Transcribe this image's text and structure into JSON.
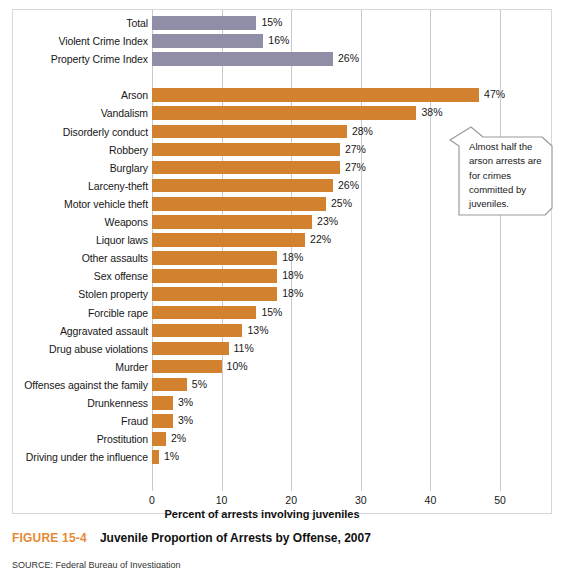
{
  "figure": {
    "number_label": "FIGURE 15-4",
    "title": "Juvenile Proportion of Arrests by Offense, 2007",
    "source_note": "SOURCE: Federal Bureau of Investigation"
  },
  "axis": {
    "x_title": "Percent of arrests involving juveniles",
    "x_ticks": [
      "0",
      "10",
      "20",
      "30",
      "40",
      "50"
    ],
    "x_min": 0,
    "x_max": 50
  },
  "callout": {
    "text": "Almost half the arson arrests are for crimes committed by juveniles."
  },
  "colors": {
    "summary_bar": "#8f8ea6",
    "offense_bar": "#d2822f",
    "caption_accent": "#e58a33",
    "gridline": "#c9c9d2"
  },
  "chart_data": {
    "type": "bar",
    "orientation": "horizontal",
    "title": "Juvenile Proportion of Arrests by Offense, 2007",
    "xlabel": "Percent of arrests involving juveniles",
    "ylabel": "",
    "xlim": [
      0,
      50
    ],
    "grid": true,
    "legend": "none",
    "categories": [
      "Total",
      "Violent Crime Index",
      "Property Crime Index",
      "Arson",
      "Vandalism",
      "Disorderly conduct",
      "Robbery",
      "Burglary",
      "Larceny-theft",
      "Motor vehicle theft",
      "Weapons",
      "Liquor laws",
      "Other assaults",
      "Sex offense",
      "Stolen property",
      "Forcible rape",
      "Aggravated assault",
      "Drug abuse violations",
      "Murder",
      "Offenses against the family",
      "Drunkenness",
      "Fraud",
      "Prostitution",
      "Driving under the influence"
    ],
    "values": [
      15,
      16,
      26,
      47,
      38,
      28,
      27,
      27,
      26,
      25,
      23,
      22,
      18,
      18,
      18,
      15,
      13,
      11,
      10,
      5,
      3,
      3,
      2,
      1
    ],
    "value_labels": [
      "15%",
      "16%",
      "26%",
      "47%",
      "38%",
      "28%",
      "27%",
      "27%",
      "26%",
      "25%",
      "23%",
      "22%",
      "18%",
      "18%",
      "18%",
      "15%",
      "13%",
      "11%",
      "10%",
      "5%",
      "3%",
      "3%",
      "2%",
      "1%"
    ],
    "groups": [
      {
        "name": "summary",
        "color": "#8f8ea6",
        "indices": [
          0,
          1,
          2
        ]
      },
      {
        "name": "offense",
        "color": "#d2822f",
        "indices": [
          3,
          4,
          5,
          6,
          7,
          8,
          9,
          10,
          11,
          12,
          13,
          14,
          15,
          16,
          17,
          18,
          19,
          20,
          21,
          22,
          23
        ]
      }
    ],
    "bars": [
      {
        "label": "Total",
        "value": 15,
        "value_label": "15%",
        "group": "summary"
      },
      {
        "label": "Violent Crime Index",
        "value": 16,
        "value_label": "16%",
        "group": "summary"
      },
      {
        "label": "Property Crime Index",
        "value": 26,
        "value_label": "26%",
        "group": "summary"
      },
      {
        "label": "Arson",
        "value": 47,
        "value_label": "47%",
        "group": "offense"
      },
      {
        "label": "Vandalism",
        "value": 38,
        "value_label": "38%",
        "group": "offense"
      },
      {
        "label": "Disorderly conduct",
        "value": 28,
        "value_label": "28%",
        "group": "offense"
      },
      {
        "label": "Robbery",
        "value": 27,
        "value_label": "27%",
        "group": "offense"
      },
      {
        "label": "Burglary",
        "value": 27,
        "value_label": "27%",
        "group": "offense"
      },
      {
        "label": "Larceny-theft",
        "value": 26,
        "value_label": "26%",
        "group": "offense"
      },
      {
        "label": "Motor vehicle theft",
        "value": 25,
        "value_label": "25%",
        "group": "offense"
      },
      {
        "label": "Weapons",
        "value": 23,
        "value_label": "23%",
        "group": "offense"
      },
      {
        "label": "Liquor laws",
        "value": 22,
        "value_label": "22%",
        "group": "offense"
      },
      {
        "label": "Other assaults",
        "value": 18,
        "value_label": "18%",
        "group": "offense"
      },
      {
        "label": "Sex offense",
        "value": 18,
        "value_label": "18%",
        "group": "offense"
      },
      {
        "label": "Stolen property",
        "value": 18,
        "value_label": "18%",
        "group": "offense"
      },
      {
        "label": "Forcible rape",
        "value": 15,
        "value_label": "15%",
        "group": "offense"
      },
      {
        "label": "Aggravated assault",
        "value": 13,
        "value_label": "13%",
        "group": "offense"
      },
      {
        "label": "Drug abuse violations",
        "value": 11,
        "value_label": "11%",
        "group": "offense"
      },
      {
        "label": "Murder",
        "value": 10,
        "value_label": "10%",
        "group": "offense"
      },
      {
        "label": "Offenses against the family",
        "value": 5,
        "value_label": "5%",
        "group": "offense"
      },
      {
        "label": "Drunkenness",
        "value": 3,
        "value_label": "3%",
        "group": "offense"
      },
      {
        "label": "Fraud",
        "value": 3,
        "value_label": "3%",
        "group": "offense"
      },
      {
        "label": "Prostitution",
        "value": 2,
        "value_label": "2%",
        "group": "offense"
      },
      {
        "label": "Driving under the influence",
        "value": 1,
        "value_label": "1%",
        "group": "offense"
      }
    ],
    "annotations": [
      {
        "text": "Almost half the arson arrests are for crimes committed by juveniles.",
        "points_to": "Arson"
      }
    ]
  }
}
